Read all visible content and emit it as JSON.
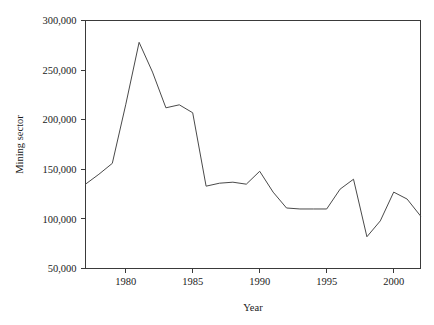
{
  "chart_data": {
    "type": "line",
    "title": "",
    "xlabel": "Year",
    "ylabel": "Mining sector",
    "xlim": [
      1977,
      2002
    ],
    "ylim": [
      50000,
      300000
    ],
    "grid": false,
    "legend": null,
    "xticks": [
      1980,
      1985,
      1990,
      1995,
      2000
    ],
    "xtick_labels": [
      "1980",
      "1985",
      "1990",
      "1995",
      "2000"
    ],
    "yticks": [
      50000,
      100000,
      150000,
      200000,
      250000,
      300000
    ],
    "ytick_labels": [
      "50,000",
      "100,000",
      "150,000",
      "200,000",
      "250,000",
      "300,000"
    ],
    "series": [
      {
        "name": "Mining sector",
        "color": "#4a4a4a",
        "x": [
          1977,
          1978,
          1979,
          1980,
          1981,
          1982,
          1983,
          1984,
          1985,
          1986,
          1987,
          1988,
          1989,
          1990,
          1991,
          1992,
          1993,
          1994,
          1995,
          1996,
          1997,
          1998,
          1999,
          2000,
          2001,
          2002
        ],
        "values": [
          135000,
          145000,
          156000,
          215000,
          278000,
          248000,
          212000,
          215000,
          207000,
          133000,
          136000,
          137000,
          135000,
          148000,
          127000,
          111000,
          110000,
          110000,
          110000,
          130000,
          140000,
          82000,
          98000,
          127000,
          120000,
          103000
        ]
      }
    ]
  },
  "axes": {
    "y_axis_title": "Mining sector",
    "x_axis_title": "Year"
  }
}
